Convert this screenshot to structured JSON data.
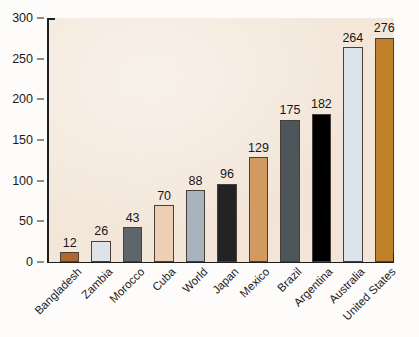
{
  "chart_data": {
    "type": "bar",
    "title": "",
    "subtitle": "",
    "xlabel": "",
    "ylabel": "",
    "categories": [
      "Bangladesh",
      "Zambia",
      "Morocco",
      "Cuba",
      "World",
      "Japan",
      "Mexico",
      "Brazil",
      "Argentina",
      "Australia",
      "United States"
    ],
    "values": [
      12,
      26,
      43,
      70,
      88,
      96,
      129,
      175,
      182,
      264,
      276
    ],
    "value_labels": [
      "12",
      "26",
      "43",
      "70",
      "88",
      "96",
      "129",
      "175",
      "182",
      "264",
      "276"
    ],
    "bar_colors": [
      "#b0682c",
      "#dde3e8",
      "#5f666b",
      "#eccfb4",
      "#a7b4bd",
      "#232326",
      "#d09a60",
      "#4e565c",
      "#000000",
      "#dbe3ea",
      "#bf8029"
    ],
    "ylim": [
      0,
      300
    ],
    "ytick_labels": [
      "0",
      "50",
      "100",
      "150",
      "200",
      "250",
      "300"
    ],
    "ytick_values": [
      0,
      50,
      100,
      150,
      200,
      250,
      300
    ],
    "grid": false,
    "legend": null,
    "legend_position": "none",
    "plot_background": "#f3e7da",
    "page_background": "#fdfcfb",
    "axis_color": "#1f1f1f",
    "bar_edge_color": "#4a3f36",
    "label_rotation_degrees": -45
  }
}
